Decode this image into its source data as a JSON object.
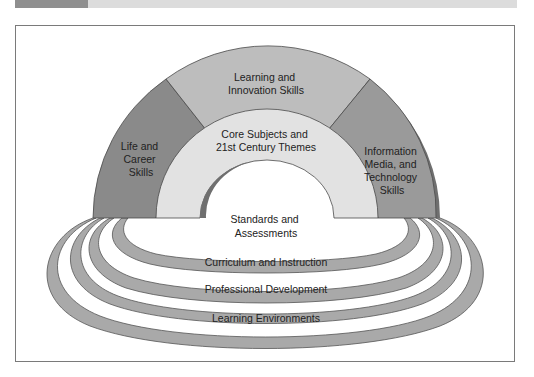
{
  "figure": {
    "header_tab_color": "#8f8f8f",
    "header_bar_color": "#dcdcdc",
    "arch": {
      "top_segment": {
        "lines": [
          "Learning and",
          "Innovation Skills"
        ],
        "color": "#bdbdbd"
      },
      "left_segment": {
        "lines": [
          "Life and",
          "Career",
          "Skills"
        ],
        "color": "#8a8a8a"
      },
      "right_segment": {
        "lines": [
          "Information",
          "Media, and",
          "Technology",
          "Skills"
        ],
        "color": "#9a9a9a"
      },
      "core": {
        "lines": [
          "Core Subjects and",
          "21st Century Themes"
        ],
        "color": "#e2e2e2"
      }
    },
    "support_systems": [
      {
        "lines": [
          "Standards and",
          "Assessments"
        ]
      },
      {
        "lines": [
          "Curriculum and Instruction"
        ]
      },
      {
        "lines": [
          "Professional Development"
        ]
      },
      {
        "lines": [
          "Learning Environments"
        ]
      }
    ],
    "ring_color": "#a9a9a9"
  }
}
